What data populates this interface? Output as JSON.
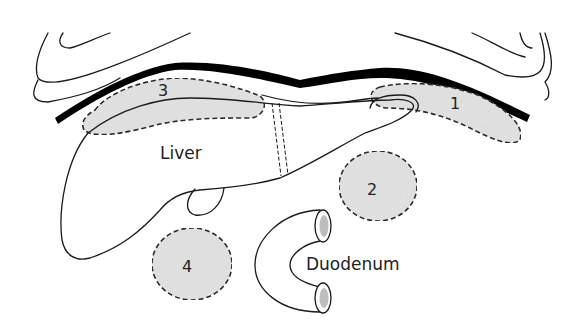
{
  "diagram": {
    "type": "anatomical-diagram",
    "structures": [
      {
        "id": "liver",
        "label": "Liver"
      },
      {
        "id": "duodenum",
        "label": "Duodenum"
      }
    ],
    "zones": [
      {
        "id": "zone-1",
        "label": "1"
      },
      {
        "id": "zone-2",
        "label": "2"
      },
      {
        "id": "zone-3",
        "label": "3"
      },
      {
        "id": "zone-4",
        "label": "4"
      }
    ],
    "colors": {
      "line": "#1a1a1a",
      "zone_fill": "#e4e4e4",
      "diaphragm": "#000000",
      "lumen": "#bdbdbd"
    }
  }
}
